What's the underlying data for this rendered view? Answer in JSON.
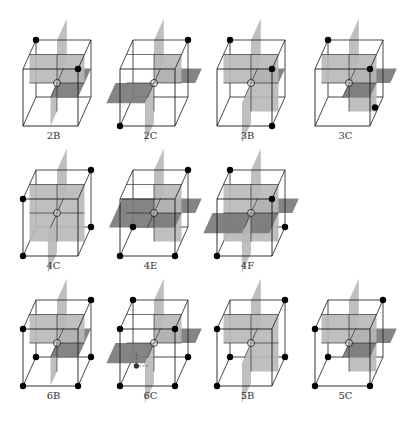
{
  "figure": {
    "colors": {
      "edge": "#1a1a1a",
      "light_plane": "#b8b8b8",
      "dark_plane": "#7a7a7a",
      "vertex": "#000000",
      "background": "#ffffff"
    },
    "legend_note": "Planes: light = vertical, dark = horizontal; filled dots mark cube vertices",
    "panels": [
      {
        "label": "2B",
        "row": 0,
        "col": 0,
        "vertices": [
          "btl",
          "ftr"
        ],
        "planes": [
          "v-upper-left",
          "v-sag-upper",
          "h-back-right-low",
          "h-front-right-low"
        ],
        "variant": "2B"
      },
      {
        "label": "2C",
        "row": 0,
        "col": 1,
        "vertices": [
          "btr",
          "fbl"
        ],
        "variant": "2C"
      },
      {
        "label": "3B",
        "row": 0,
        "col": 2,
        "vertices": [
          "btl",
          "ftr",
          "fbr"
        ],
        "variant": "3B"
      },
      {
        "label": "3C",
        "row": 0,
        "col": 3,
        "vertices": [
          "btl",
          "ftr",
          "bmr"
        ],
        "variant": "3C"
      },
      {
        "label": "4C",
        "row": 1,
        "col": 0,
        "vertices": [
          "btr",
          "ftl",
          "bbr",
          "fbl"
        ],
        "variant": "4C"
      },
      {
        "label": "4E",
        "row": 1,
        "col": 1,
        "vertices": [
          "btr",
          "bbl",
          "fbl",
          "fbr"
        ],
        "variant": "4E"
      },
      {
        "label": "4F",
        "row": 1,
        "col": 2,
        "vertices": [
          "btl",
          "ftr",
          "bbr",
          "fbl"
        ],
        "variant": "4F"
      },
      {
        "label": "6B",
        "row": 2,
        "col": 0,
        "vertices": [
          "btr",
          "ftl",
          "bbl",
          "bbr",
          "fbl",
          "fbr"
        ],
        "variant": "6B"
      },
      {
        "label": "6C",
        "row": 2,
        "col": 1,
        "vertices": [
          "btl",
          "ftr",
          "bbr",
          "fbl",
          "fbr",
          "ftl"
        ],
        "variant": "6C"
      },
      {
        "label": "5B",
        "row": 2,
        "col": 2,
        "vertices": [
          "btr",
          "ftl",
          "bbl",
          "bbr",
          "fbl"
        ],
        "variant": "5B"
      },
      {
        "label": "5C",
        "row": 2,
        "col": 3,
        "vertices": [
          "btr",
          "ftl",
          "bbl",
          "fbl",
          "fbr"
        ],
        "variant": "5C"
      }
    ]
  }
}
